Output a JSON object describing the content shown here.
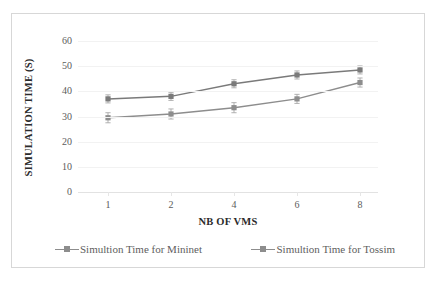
{
  "chart_data": {
    "type": "line",
    "title": "",
    "xlabel": "NB OF VMS",
    "ylabel": "SIMULATION TIME (S)",
    "categories": [
      "1",
      "2",
      "4",
      "6",
      "8"
    ],
    "x": [
      1,
      2,
      4,
      6,
      8
    ],
    "ylim": [
      0,
      60
    ],
    "yticks": [
      "0",
      "10",
      "20",
      "30",
      "40",
      "50",
      "60"
    ],
    "ytick_values": [
      0,
      10,
      20,
      30,
      40,
      50,
      60
    ],
    "grid": "horizontal-light",
    "legend_position": "bottom",
    "series": [
      {
        "name": "Simultion Time for Mininet",
        "values": [
          29.5,
          31,
          33.5,
          37,
          43.5
        ],
        "errors": [
          2.0,
          2.0,
          2.0,
          1.8,
          1.8
        ],
        "color": "#8d8d8d",
        "marker": "square"
      },
      {
        "name": "Simultion Time for Tossim",
        "values": [
          37,
          38,
          43,
          46.5,
          48.5
        ],
        "errors": [
          1.6,
          1.6,
          1.6,
          1.6,
          1.6
        ],
        "color": "#7a7a7a",
        "marker": "square"
      }
    ]
  },
  "legend": {
    "entries": [
      {
        "label": "Simultion Time for Mininet"
      },
      {
        "label": "Simultion Time for Tossim"
      }
    ]
  },
  "colors": {
    "series_1": "#8d8d8d",
    "series_2": "#7a7a7a",
    "border": "#d7d7d7",
    "grid": "#f2f2f2",
    "axis_text": "#5b5b5b",
    "title_text": "#2b2b2b",
    "background": "#ffffff"
  }
}
